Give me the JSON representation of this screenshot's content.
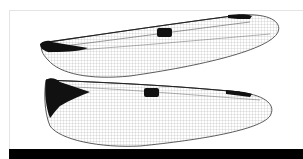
{
  "image": {
    "subject": "dragonfly wings",
    "wings": [
      {
        "name": "forewing",
        "pterostigma": true,
        "nodus_mark": true
      },
      {
        "name": "hindwing",
        "pterostigma": true,
        "nodus_mark": true,
        "basal_patch": true
      }
    ],
    "colors": {
      "background": "#ffffff",
      "venation": "#555555",
      "markings": "#111111",
      "bar": "#000000"
    }
  }
}
